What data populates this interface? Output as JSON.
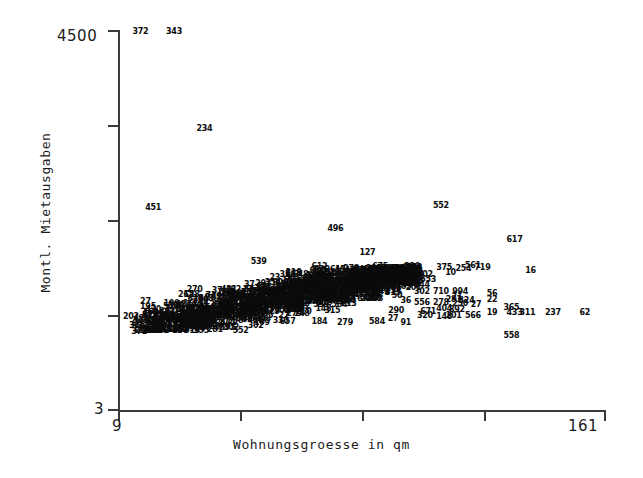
{
  "chart_data": {
    "type": "scatter",
    "title": "",
    "xlabel": "Wohnungsgroesse in qm",
    "ylabel": "Montl. Mietausgaben",
    "xlim": [
      9,
      161
    ],
    "ylim": [
      3,
      4500
    ],
    "x_tick_labels": [
      "9",
      "161"
    ],
    "y_tick_labels": [
      "4500",
      "3"
    ],
    "x_tick_count": 5,
    "y_tick_count": 5,
    "grid": false,
    "legend": null,
    "point_label_mode": "id-number",
    "points": [
      {
        "label": "372",
        "x": 16.0,
        "y": 4480
      },
      {
        "label": "343",
        "x": 26.5,
        "y": 4480
      },
      {
        "label": "234",
        "x": 36.0,
        "y": 3330
      },
      {
        "label": "451",
        "x": 20.0,
        "y": 2390
      },
      {
        "label": "552",
        "x": 110.0,
        "y": 2420
      },
      {
        "label": "496",
        "x": 77.0,
        "y": 2150
      },
      {
        "label": "617",
        "x": 133.0,
        "y": 2010
      },
      {
        "label": "127",
        "x": 87.0,
        "y": 1860
      },
      {
        "label": "539",
        "x": 53.0,
        "y": 1760
      },
      {
        "label": "612",
        "x": 72.0,
        "y": 1700
      },
      {
        "label": "675",
        "x": 91.0,
        "y": 1700
      },
      {
        "label": "220",
        "x": 101.0,
        "y": 1700
      },
      {
        "label": "561",
        "x": 120.0,
        "y": 1710
      },
      {
        "label": "719",
        "x": 123.0,
        "y": 1680
      },
      {
        "label": "375",
        "x": 111.0,
        "y": 1680
      },
      {
        "label": "254",
        "x": 117.0,
        "y": 1675
      },
      {
        "label": "16",
        "x": 138.0,
        "y": 1650
      },
      {
        "label": "429",
        "x": 84.0,
        "y": 1640
      },
      {
        "label": "144",
        "x": 91.0,
        "y": 1645
      },
      {
        "label": "10",
        "x": 113.0,
        "y": 1630
      },
      {
        "label": "358",
        "x": 62.0,
        "y": 1600
      },
      {
        "label": "648",
        "x": 66.0,
        "y": 1598
      },
      {
        "label": "502",
        "x": 105.0,
        "y": 1600
      },
      {
        "label": "23",
        "x": 58.0,
        "y": 1560
      },
      {
        "label": "216",
        "x": 64.0,
        "y": 1555
      },
      {
        "label": "674",
        "x": 69.0,
        "y": 1550
      },
      {
        "label": "564",
        "x": 73.0,
        "y": 1548
      },
      {
        "label": "553",
        "x": 106.0,
        "y": 1545
      },
      {
        "label": "57",
        "x": 93.0,
        "y": 1540
      },
      {
        "label": "50",
        "x": 103.0,
        "y": 1560
      },
      {
        "label": "34",
        "x": 72.0,
        "y": 1500
      },
      {
        "label": "503",
        "x": 68.0,
        "y": 1498
      },
      {
        "label": "608",
        "x": 82.0,
        "y": 1490
      },
      {
        "label": "421",
        "x": 87.0,
        "y": 1488
      },
      {
        "label": "219",
        "x": 91.0,
        "y": 1485
      },
      {
        "label": "220b",
        "x": 97.0,
        "y": 1483
      },
      {
        "label": "244",
        "x": 104.0,
        "y": 1480
      },
      {
        "label": "270",
        "x": 33.0,
        "y": 1420
      },
      {
        "label": "37",
        "x": 40.0,
        "y": 1415
      },
      {
        "label": "482",
        "x": 45.0,
        "y": 1425
      },
      {
        "label": "56x",
        "x": 50.0,
        "y": 1420
      },
      {
        "label": "302",
        "x": 104.0,
        "y": 1400
      },
      {
        "label": "710",
        "x": 110.0,
        "y": 1400
      },
      {
        "label": "994",
        "x": 116.0,
        "y": 1405
      },
      {
        "label": "315",
        "x": 95.0,
        "y": 1390
      },
      {
        "label": "128",
        "x": 32.0,
        "y": 1360
      },
      {
        "label": "71",
        "x": 38.0,
        "y": 1358
      },
      {
        "label": "56",
        "x": 126.0,
        "y": 1380
      },
      {
        "label": "22",
        "x": 126.0,
        "y": 1310
      },
      {
        "label": "21",
        "x": 115.0,
        "y": 1340
      },
      {
        "label": "281",
        "x": 114.0,
        "y": 1300
      },
      {
        "label": "324",
        "x": 118.0,
        "y": 1295
      },
      {
        "label": "425",
        "x": 88.0,
        "y": 1330
      },
      {
        "label": "36",
        "x": 99.0,
        "y": 1290
      },
      {
        "label": "556",
        "x": 104.0,
        "y": 1270
      },
      {
        "label": "278",
        "x": 110.0,
        "y": 1272
      },
      {
        "label": "250",
        "x": 116.0,
        "y": 1255
      },
      {
        "label": "27",
        "x": 121.0,
        "y": 1250
      },
      {
        "label": "804",
        "x": 27.0,
        "y": 1240
      },
      {
        "label": "420",
        "x": 20.0,
        "y": 1190
      },
      {
        "label": "365",
        "x": 132.0,
        "y": 1210
      },
      {
        "label": "892",
        "x": 115.0,
        "y": 1190
      },
      {
        "label": "404",
        "x": 111.0,
        "y": 1195
      },
      {
        "label": "19",
        "x": 126.0,
        "y": 1150
      },
      {
        "label": "433",
        "x": 133.0,
        "y": 1155
      },
      {
        "label": "311",
        "x": 137.0,
        "y": 1150
      },
      {
        "label": "237",
        "x": 145.0,
        "y": 1155
      },
      {
        "label": "62",
        "x": 155.0,
        "y": 1155
      },
      {
        "label": "671",
        "x": 106.0,
        "y": 1160
      },
      {
        "label": "290",
        "x": 96.0,
        "y": 1170
      },
      {
        "label": "202",
        "x": 13.0,
        "y": 1110
      },
      {
        "label": "566",
        "x": 120.0,
        "y": 1115
      },
      {
        "label": "320",
        "x": 105.0,
        "y": 1120
      },
      {
        "label": "148",
        "x": 111.0,
        "y": 1105
      },
      {
        "label": "201",
        "x": 114.0,
        "y": 1120
      },
      {
        "label": "321",
        "x": 16.0,
        "y": 1060
      },
      {
        "label": "305",
        "x": 23.0,
        "y": 1065
      },
      {
        "label": "27b",
        "x": 95.0,
        "y": 1080
      },
      {
        "label": "584",
        "x": 90.0,
        "y": 1040
      },
      {
        "label": "91",
        "x": 99.0,
        "y": 1030
      },
      {
        "label": "279",
        "x": 80.0,
        "y": 1035
      },
      {
        "label": "184",
        "x": 72.0,
        "y": 1045
      },
      {
        "label": "657",
        "x": 62.0,
        "y": 1040
      },
      {
        "label": "109",
        "x": 54.0,
        "y": 1038
      },
      {
        "label": "358b",
        "x": 28.0,
        "y": 1020
      },
      {
        "label": "698",
        "x": 32.0,
        "y": 1030
      },
      {
        "label": "558",
        "x": 132.0,
        "y": 880
      }
    ]
  },
  "axes": {
    "y_max": "4500",
    "y_min": "3",
    "x_min": "9",
    "x_max": "161",
    "x_title": "Wohnungsgroesse in qm",
    "y_title": "Montl. Mietausgaben"
  },
  "cluster_labels": [
    "270",
    "128",
    "482",
    "37",
    "23",
    "216",
    "358",
    "648",
    "674",
    "564",
    "34",
    "503",
    "608",
    "421",
    "219",
    "244",
    "302",
    "710",
    "994",
    "315",
    "425",
    "36",
    "556",
    "278",
    "250",
    "27",
    "804",
    "420",
    "202",
    "321",
    "305",
    "290",
    "671",
    "320",
    "148",
    "201",
    "584",
    "91",
    "279",
    "184",
    "657",
    "109",
    "358",
    "698",
    "892",
    "404",
    "566",
    "19",
    "22",
    "56",
    "21",
    "281",
    "324",
    "553",
    "57",
    "50",
    "502",
    "10",
    "375",
    "254",
    "561",
    "719",
    "16",
    "429",
    "144",
    "675",
    "220",
    "612",
    "539",
    "127",
    "496",
    "617",
    "552",
    "451",
    "234",
    "343",
    "372",
    "365",
    "433",
    "311",
    "237",
    "62",
    "558",
    "432",
    "596",
    "176",
    "213",
    "460",
    "318",
    "741",
    "689",
    "215",
    "481",
    "267",
    "139",
    "354",
    "822",
    "630",
    "177",
    "288",
    "543",
    "119",
    "620",
    "391",
    "268",
    "447",
    "152",
    "703",
    "265",
    "338",
    "509",
    "174",
    "626",
    "380",
    "291",
    "457",
    "512",
    "208",
    "643",
    "330",
    "195",
    "471",
    "286",
    "355",
    "617",
    "204",
    "748"
  ]
}
